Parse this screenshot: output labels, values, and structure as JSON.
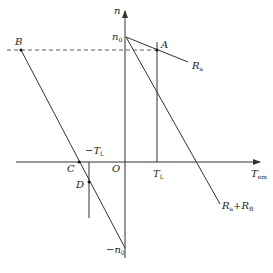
{
  "diagram": {
    "type": "mechanical characteristic of DC motor (speed vs torque)",
    "axes": {
      "y_label": "n",
      "x_label_main": "T",
      "x_label_sub": "em",
      "origin_label": "O"
    },
    "points": {
      "n0": {
        "main": "n",
        "sub": "0"
      },
      "neg_n0": {
        "main": "−n",
        "sub": "0"
      },
      "A": "A",
      "B": "B",
      "C": "C",
      "D": "D"
    },
    "torque_marks": {
      "TL": {
        "main": "T",
        "sub": "L"
      },
      "neg_TL": {
        "main": "−T",
        "sub": "L"
      }
    },
    "curves": {
      "Ra": {
        "main": "R",
        "sub": "a"
      },
      "RaRb": {
        "main1": "R",
        "sub1": "a",
        "plus": "+",
        "main2": "R",
        "sub2": "B"
      }
    },
    "colors": {
      "line": "#333333",
      "background": "#ffffff"
    }
  }
}
